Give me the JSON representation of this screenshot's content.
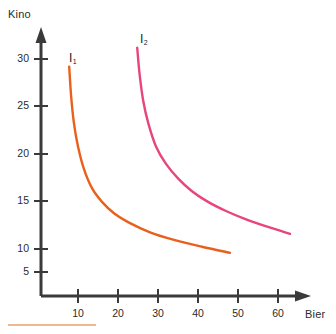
{
  "chart_data": {
    "type": "line",
    "title": "",
    "subtitle": "",
    "xlabel": "Bier",
    "ylabel": "Kino",
    "xlim": [
      0,
      68
    ],
    "ylim": [
      0,
      33
    ],
    "xticks": [
      10,
      20,
      30,
      40,
      50,
      60
    ],
    "yticks": [
      5,
      10,
      15,
      20,
      25,
      30
    ],
    "grid": false,
    "legend": "none",
    "annotations": [
      {
        "name": "curve-1-label",
        "text": "I",
        "subscript": "1",
        "x": 9.5,
        "y": 31.5
      },
      {
        "name": "curve-2-label",
        "text": "I",
        "subscript": "2",
        "x": 27.5,
        "y": 33.0
      }
    ],
    "series": [
      {
        "name": "I1",
        "label": "I",
        "subscript": "1",
        "color": "#E8601C",
        "description": "indifference curve 1",
        "points": [
          {
            "x": 7.8,
            "y": 29.0
          },
          {
            "x": 8.3,
            "y": 25.0
          },
          {
            "x": 9.0,
            "y": 21.5
          },
          {
            "x": 10.0,
            "y": 18.5
          },
          {
            "x": 11.5,
            "y": 15.5
          },
          {
            "x": 13.5,
            "y": 13.0
          },
          {
            "x": 16.0,
            "y": 11.2
          },
          {
            "x": 19.0,
            "y": 9.7
          },
          {
            "x": 23.0,
            "y": 8.4
          },
          {
            "x": 28.0,
            "y": 7.2
          },
          {
            "x": 34.0,
            "y": 6.2
          },
          {
            "x": 41.0,
            "y": 5.3
          },
          {
            "x": 48.0,
            "y": 4.5
          }
        ]
      },
      {
        "name": "I2",
        "label": "I",
        "subscript": "2",
        "color": "#E8457C",
        "description": "indifference curve 2",
        "points": [
          {
            "x": 24.8,
            "y": 31.5
          },
          {
            "x": 25.4,
            "y": 28.0
          },
          {
            "x": 26.3,
            "y": 24.5
          },
          {
            "x": 27.6,
            "y": 21.5
          },
          {
            "x": 29.5,
            "y": 18.5
          },
          {
            "x": 32.0,
            "y": 16.2
          },
          {
            "x": 35.0,
            "y": 14.3
          },
          {
            "x": 38.5,
            "y": 12.6
          },
          {
            "x": 42.5,
            "y": 11.2
          },
          {
            "x": 47.0,
            "y": 10.0
          },
          {
            "x": 52.0,
            "y": 8.9
          },
          {
            "x": 57.5,
            "y": 7.9
          },
          {
            "x": 63.0,
            "y": 7.0
          }
        ]
      }
    ]
  },
  "axes": {
    "axis_color": "#3a3a3a",
    "y_title": "Kino",
    "x_title": "Bier",
    "y_tick_labels": [
      "30",
      "25",
      "20",
      "15",
      "10",
      "5"
    ],
    "x_tick_labels": [
      "10",
      "20",
      "30",
      "40",
      "50",
      "60"
    ]
  },
  "artifact": {
    "name": "bottom-edge-line",
    "color": "#E8A06E",
    "visible": true
  }
}
